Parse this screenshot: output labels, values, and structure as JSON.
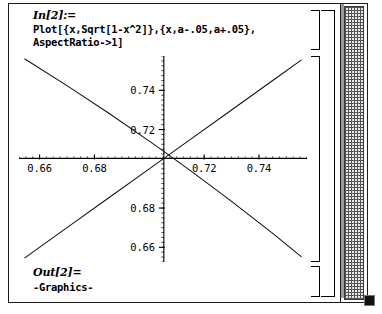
{
  "window": {
    "title": "Mathematica Notebook"
  },
  "input_cell": {
    "prompt": "In[2]:=",
    "code_line_1": "Plot[{x,Sqrt[1-x^2]},{x,a-.05,a+.05},",
    "code_line_2": "AspectRatio->1]"
  },
  "output_cell": {
    "prompt": "Out[2]=",
    "value": "-Graphics-"
  },
  "scrollbar": {
    "name": "vertical-scrollbar"
  },
  "chart_data": {
    "type": "line",
    "title": "",
    "xlabel": "",
    "ylabel": "",
    "xlim": [
      0.6525,
      0.7575
    ],
    "ylim": [
      0.6525,
      0.7575
    ],
    "grid": false,
    "legend": "none",
    "xticks": [
      0.66,
      0.68,
      0.72,
      0.74
    ],
    "xtick_labels": [
      "0.66",
      "0.68",
      "0.72",
      "0.74"
    ],
    "yticks": [
      0.66,
      0.68,
      0.72,
      0.74
    ],
    "ytick_labels": [
      "0.66",
      "0.68",
      "0.72",
      "0.74"
    ],
    "axis_origin_x": 0.7053,
    "axis_origin_y": 0.7053,
    "series": [
      {
        "name": "y = x",
        "direction": "rising",
        "points": [
          [
            0.6545,
            0.6545
          ],
          [
            0.67,
            0.67
          ],
          [
            0.685,
            0.685
          ],
          [
            0.7,
            0.7
          ],
          [
            0.715,
            0.715
          ],
          [
            0.73,
            0.73
          ],
          [
            0.745,
            0.745
          ],
          [
            0.7555,
            0.7555
          ]
        ]
      },
      {
        "name": "y = Sqrt[1-x^2]",
        "direction": "falling",
        "points": [
          [
            0.6545,
            0.7561
          ],
          [
            0.67,
            0.7424
          ],
          [
            0.685,
            0.7286
          ],
          [
            0.7,
            0.7141
          ],
          [
            0.7053,
            0.7089
          ],
          [
            0.715,
            0.6991
          ],
          [
            0.73,
            0.6834
          ],
          [
            0.745,
            0.6671
          ],
          [
            0.7555,
            0.6551
          ]
        ]
      }
    ]
  }
}
